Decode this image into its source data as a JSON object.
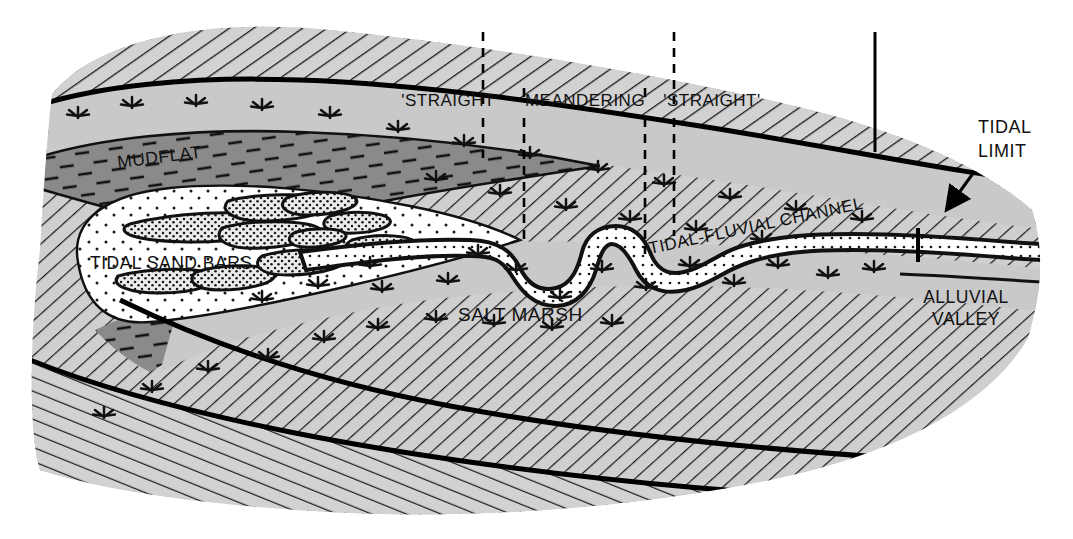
{
  "figure": {
    "kind": "estuary-depositional-zonation-map",
    "background_color": "#ffffff",
    "line_color": "#000000"
  },
  "palette": {
    "salt_marsh_fill": "#c9c9c9",
    "mudflat_fill": "#8a8a8a",
    "alluvial_hatch_fill": "#cfcfcf",
    "subtidal_fill": "#ffffff",
    "sand_bar_fill": "#e4e4e4",
    "channel_fill": "#ffffff",
    "outline": "#000000"
  },
  "labels": {
    "mudflat": "MUDFLAT",
    "tidal_sand_bars": "TIDAL SAND BARS",
    "salt_marsh": "SALT MARSH",
    "tidal_fluvial_channel": "TIDAL-FLUVIAL CHANNEL",
    "alluvial_valley_line1": "ALLUVIAL",
    "alluvial_valley_line2": "VALLEY",
    "tidal_limit_line1": "TIDAL",
    "tidal_limit_line2": "LIMIT"
  },
  "zones": {
    "items": [
      {
        "id": "straight-outer",
        "label": "'STRAIGHT'",
        "center_x": 450
      },
      {
        "id": "meandering",
        "label": "MEANDERING",
        "center_x": 585
      },
      {
        "id": "straight-inner",
        "label": "'STRAIGHT'",
        "center_x": 712
      }
    ],
    "dividers": [
      {
        "id": "divider-1",
        "x": 483,
        "y_top": 32,
        "y_bottom": 133,
        "style": "dashed",
        "segment": "upper"
      },
      {
        "id": "divider-1b",
        "x": 483,
        "y_top": 115,
        "y_bottom": 155,
        "style": "dashed",
        "segment": "lower"
      },
      {
        "id": "divider-2",
        "x": 524,
        "y_top": 88,
        "y_bottom": 240,
        "style": "dashed",
        "segment": "full"
      },
      {
        "id": "divider-3",
        "x": 645,
        "y_top": 88,
        "y_bottom": 252,
        "style": "dashed",
        "segment": "full"
      },
      {
        "id": "divider-4",
        "x": 674,
        "y_top": 32,
        "y_bottom": 133,
        "style": "dashed",
        "segment": "upper"
      },
      {
        "id": "divider-4b",
        "x": 674,
        "y_top": 115,
        "y_bottom": 235,
        "style": "dashed",
        "segment": "lower"
      }
    ],
    "tidal_limit_marker": {
      "id": "tidal-limit-rule",
      "x": 875,
      "y_top": 32,
      "y_bottom": 152,
      "style": "solid"
    },
    "channel_tick": {
      "id": "tidal-limit-tick",
      "x": 918,
      "y_top": 228,
      "y_bottom": 262
    }
  },
  "annotations": {
    "tidal_limit_arrow": {
      "from_x": 958,
      "from_y": 178,
      "to_x": 946,
      "to_y": 212
    }
  }
}
